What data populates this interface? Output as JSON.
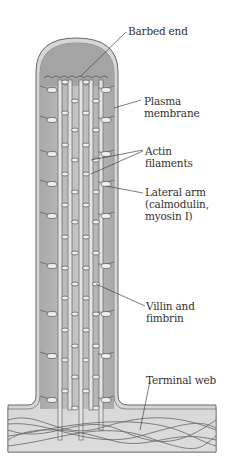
{
  "diagram": {
    "labels": {
      "barbed_end": "Barbed end",
      "plasma_membrane_1": "Plasma",
      "plasma_membrane_2": "membrane",
      "actin_filaments_1": "Actin",
      "actin_filaments_2": "filaments",
      "lateral_arm_1": "Lateral arm",
      "lateral_arm_2": "(calmodulin,",
      "lateral_arm_3": "myosin I)",
      "villin_fimbrin_1": "Villin and",
      "villin_fimbrin_2": "fimbrin",
      "terminal_web": "Terminal web"
    },
    "colors": {
      "membrane": "#d8d8d8",
      "cytoplasm": "#b9b9b9",
      "filament": "#e6e6e6",
      "outline": "#555555",
      "text": "#333333"
    }
  }
}
